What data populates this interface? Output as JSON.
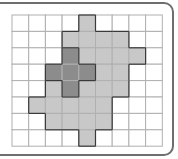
{
  "diagram": {
    "type": "shaded-grid",
    "rows": 8,
    "columns": 9,
    "colors": {
      "empty": "#ffffff",
      "light": "#c8c8c8",
      "dark": "#8c8c8c",
      "gridline": "#b0b0b0",
      "region_border": "#3a3a3a"
    },
    "cells": [
      [
        0,
        0,
        0,
        0,
        1,
        0,
        0,
        0,
        0
      ],
      [
        0,
        0,
        0,
        1,
        1,
        1,
        1,
        0,
        0
      ],
      [
        0,
        0,
        0,
        2,
        1,
        1,
        1,
        1,
        0
      ],
      [
        0,
        0,
        2,
        2,
        2,
        1,
        1,
        0,
        0
      ],
      [
        0,
        0,
        1,
        2,
        1,
        1,
        1,
        0,
        0
      ],
      [
        0,
        1,
        1,
        1,
        1,
        1,
        0,
        0,
        0
      ],
      [
        0,
        0,
        1,
        1,
        1,
        1,
        0,
        0,
        0
      ],
      [
        0,
        0,
        0,
        0,
        1,
        0,
        0,
        0,
        0
      ]
    ],
    "legend": {
      "0": "empty",
      "1": "light",
      "2": "dark"
    }
  }
}
